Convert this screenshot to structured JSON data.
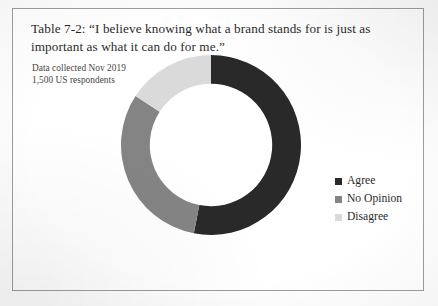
{
  "figure": {
    "caption": "Table 7-2: “I believe knowing what a brand stands for is just as important as what it can do for me.”",
    "source_note_line1": "Data collected Nov 2019",
    "source_note_line2": "1,500 US respondents"
  },
  "chart_data": {
    "type": "pie",
    "variant": "donut",
    "title": "Table 7-2: “I believe knowing what a brand stands for is just as important as what it can do for me.”",
    "subtitle": "Data collected Nov 2019 / 1,500 US respondents",
    "categories": [
      "Agree",
      "No Opinion",
      "Disagree"
    ],
    "values": [
      53,
      31,
      16
    ],
    "value_unit": "percent",
    "start_angle_deg": 0,
    "direction": "clockwise",
    "inner_radius_ratio": 0.68,
    "colors": [
      "#222222",
      "#808080",
      "#d9d9d9"
    ],
    "legend_position": "right",
    "grid": false,
    "data_labels": false,
    "slices": [
      {
        "label": "Agree",
        "value": 53,
        "sweep_deg": 191,
        "color": "#222222"
      },
      {
        "label": "No Opinion",
        "value": 31,
        "sweep_deg": 112,
        "color": "#808080"
      },
      {
        "label": "Disagree",
        "value": 16,
        "sweep_deg": 57,
        "color": "#d9d9d9"
      }
    ]
  },
  "legend": {
    "items": [
      {
        "label": "Agree",
        "color": "#222222"
      },
      {
        "label": "No Opinion",
        "color": "#808080"
      },
      {
        "label": "Disagree",
        "color": "#d9d9d9"
      }
    ]
  }
}
